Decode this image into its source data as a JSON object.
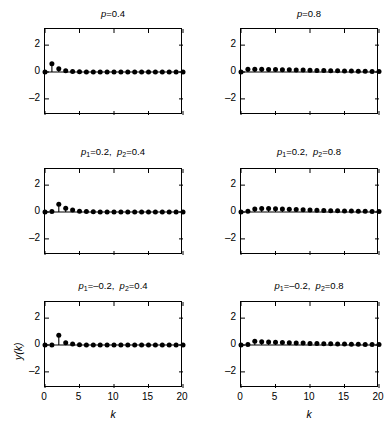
{
  "figure": {
    "width": 392,
    "height": 438,
    "background": "#ffffff",
    "ink_color": "#000000"
  },
  "axis_labels": {
    "x": "k",
    "y": "y(k)"
  },
  "chart_data": [
    {
      "type": "line",
      "panel_id": "panel-top-left",
      "title": "p=0.4",
      "title_parts": {
        "var": "p",
        "sub": "",
        "value": "=0.4"
      },
      "xlabel": "k",
      "ylabel": "y(k)",
      "xlim": [
        0,
        20
      ],
      "ylim": [
        -3.2,
        3.2
      ],
      "xticks": [
        0,
        5,
        10,
        15,
        20
      ],
      "yticks": [
        -2,
        0,
        2
      ],
      "xticklabels": [
        "0",
        "5",
        "10",
        "15",
        "20"
      ],
      "yticklabels": [
        "-2",
        "0",
        "2"
      ],
      "grid": false,
      "legend": null,
      "marker": "filled-circle",
      "stem_plot": true,
      "x": [
        0,
        1,
        2,
        3,
        4,
        5,
        6,
        7,
        8,
        9,
        10,
        11,
        12,
        13,
        14,
        15,
        16,
        17,
        18,
        19,
        20
      ],
      "values": [
        0.0,
        0.62,
        0.25,
        0.1,
        0.04,
        0.016,
        0.006,
        0.003,
        0.001,
        0.0,
        0.0,
        0.0,
        0.0,
        0.0,
        0.0,
        0.0,
        0.0,
        0.0,
        0.0,
        0.0,
        0.0
      ]
    },
    {
      "type": "line",
      "panel_id": "panel-top-right",
      "title": "p=0.8",
      "title_parts": {
        "var": "p",
        "sub": "",
        "value": "=0.8"
      },
      "xlabel": "k",
      "ylabel": "y(k)",
      "xlim": [
        0,
        20
      ],
      "ylim": [
        -3.2,
        3.2
      ],
      "xticks": [
        0,
        5,
        10,
        15,
        20
      ],
      "yticks": [
        -2,
        0,
        2
      ],
      "xticklabels": [
        "0",
        "5",
        "10",
        "15",
        "20"
      ],
      "yticklabels": [
        "-2",
        "0",
        "2"
      ],
      "grid": false,
      "legend": null,
      "marker": "filled-circle",
      "stem_plot": true,
      "x": [
        0,
        1,
        2,
        3,
        4,
        5,
        6,
        7,
        8,
        9,
        10,
        11,
        12,
        13,
        14,
        15,
        16,
        17,
        18,
        19,
        20
      ],
      "values": [
        0.0,
        0.2,
        0.2,
        0.2,
        0.19,
        0.18,
        0.17,
        0.16,
        0.15,
        0.14,
        0.13,
        0.12,
        0.11,
        0.1,
        0.09,
        0.08,
        0.07,
        0.06,
        0.05,
        0.04,
        0.03
      ]
    },
    {
      "type": "line",
      "panel_id": "panel-mid-left",
      "title": "p1=0.2, p2=0.4",
      "title_parts": {
        "var": "p",
        "sub": "1",
        "value": "=0.2,",
        "var2": "p",
        "sub2": "2",
        "value2": "=0.4"
      },
      "xlabel": "k",
      "ylabel": "y(k)",
      "xlim": [
        0,
        20
      ],
      "ylim": [
        -3.2,
        3.2
      ],
      "xticks": [
        0,
        5,
        10,
        15,
        20
      ],
      "yticks": [
        -2,
        0,
        2
      ],
      "xticklabels": [
        "0",
        "5",
        "10",
        "15",
        "20"
      ],
      "yticklabels": [
        "-2",
        "0",
        "2"
      ],
      "grid": false,
      "legend": null,
      "marker": "filled-circle",
      "stem_plot": true,
      "x": [
        0,
        1,
        2,
        3,
        4,
        5,
        6,
        7,
        8,
        9,
        10,
        11,
        12,
        13,
        14,
        15,
        16,
        17,
        18,
        19,
        20
      ],
      "values": [
        0.0,
        0.04,
        0.58,
        0.28,
        0.14,
        0.06,
        0.03,
        0.012,
        0.005,
        0.002,
        0.001,
        0.0,
        0.0,
        0.0,
        0.0,
        0.0,
        0.0,
        0.0,
        0.0,
        0.0,
        0.0
      ]
    },
    {
      "type": "line",
      "panel_id": "panel-mid-right",
      "title": "p1=0.2, p2=0.8",
      "title_parts": {
        "var": "p",
        "sub": "1",
        "value": "=0.2,",
        "var2": "p",
        "sub2": "2",
        "value2": "=0.8"
      },
      "xlabel": "k",
      "ylabel": "y(k)",
      "xlim": [
        0,
        20
      ],
      "ylim": [
        -3.2,
        3.2
      ],
      "xticks": [
        0,
        5,
        10,
        15,
        20
      ],
      "yticks": [
        -2,
        0,
        2
      ],
      "xticklabels": [
        "0",
        "5",
        "10",
        "15",
        "20"
      ],
      "yticklabels": [
        "-2",
        "0",
        "2"
      ],
      "grid": false,
      "legend": null,
      "marker": "filled-circle",
      "stem_plot": true,
      "x": [
        0,
        1,
        2,
        3,
        4,
        5,
        6,
        7,
        8,
        9,
        10,
        11,
        12,
        13,
        14,
        15,
        16,
        17,
        18,
        19,
        20
      ],
      "values": [
        0.0,
        0.05,
        0.22,
        0.26,
        0.26,
        0.25,
        0.23,
        0.21,
        0.19,
        0.17,
        0.15,
        0.13,
        0.12,
        0.1,
        0.09,
        0.08,
        0.07,
        0.06,
        0.05,
        0.04,
        0.03
      ]
    },
    {
      "type": "line",
      "panel_id": "panel-bot-left",
      "title": "p1=-0.2, p2=0.4",
      "title_parts": {
        "var": "p",
        "sub": "1",
        "value": "=–0.2,",
        "var2": "p",
        "sub2": "2",
        "value2": "=0.4"
      },
      "xlabel": "k",
      "ylabel": "y(k)",
      "xlim": [
        0,
        20
      ],
      "ylim": [
        -3.2,
        3.2
      ],
      "xticks": [
        0,
        5,
        10,
        15,
        20
      ],
      "yticks": [
        -2,
        0,
        2
      ],
      "xticklabels": [
        "0",
        "5",
        "10",
        "15",
        "20"
      ],
      "yticklabels": [
        "-2",
        "0",
        "2"
      ],
      "grid": false,
      "legend": null,
      "marker": "filled-circle",
      "stem_plot": true,
      "x": [
        0,
        1,
        2,
        3,
        4,
        5,
        6,
        7,
        8,
        9,
        10,
        11,
        12,
        13,
        14,
        15,
        16,
        17,
        18,
        19,
        20
      ],
      "values": [
        0.0,
        0.0,
        0.72,
        0.17,
        0.07,
        0.02,
        0.008,
        0.003,
        0.001,
        0.0,
        0.0,
        0.0,
        0.0,
        0.0,
        0.0,
        0.0,
        0.0,
        0.0,
        0.0,
        0.0,
        0.0
      ]
    },
    {
      "type": "line",
      "panel_id": "panel-bot-right",
      "title": "p1=-0.2, p2=0.8",
      "title_parts": {
        "var": "p",
        "sub": "1",
        "value": "=–0.2,",
        "var2": "p",
        "sub2": "2",
        "value2": "=0.8"
      },
      "xlabel": "k",
      "ylabel": "y(k)",
      "xlim": [
        0,
        20
      ],
      "ylim": [
        -3.2,
        3.2
      ],
      "xticks": [
        0,
        5,
        10,
        15,
        20
      ],
      "yticks": [
        -2,
        0,
        2
      ],
      "xticklabels": [
        "0",
        "5",
        "10",
        "15",
        "20"
      ],
      "yticklabels": [
        "-2",
        "0",
        "2"
      ],
      "grid": false,
      "legend": null,
      "marker": "filled-circle",
      "stem_plot": true,
      "x": [
        0,
        1,
        2,
        3,
        4,
        5,
        6,
        7,
        8,
        9,
        10,
        11,
        12,
        13,
        14,
        15,
        16,
        17,
        18,
        19,
        20
      ],
      "values": [
        0.0,
        0.03,
        0.28,
        0.24,
        0.22,
        0.2,
        0.18,
        0.17,
        0.15,
        0.14,
        0.12,
        0.11,
        0.1,
        0.09,
        0.08,
        0.07,
        0.06,
        0.05,
        0.04,
        0.035,
        0.03
      ]
    }
  ],
  "layout": {
    "rows": 3,
    "cols": 2,
    "panel_positions": [
      {
        "id": "panel-top-left",
        "left": 44,
        "top": 28,
        "width": 138,
        "height": 86
      },
      {
        "id": "panel-top-right",
        "left": 240,
        "top": 28,
        "width": 138,
        "height": 86
      },
      {
        "id": "panel-mid-left",
        "left": 44,
        "top": 168,
        "width": 138,
        "height": 86
      },
      {
        "id": "panel-mid-right",
        "left": 240,
        "top": 168,
        "width": 138,
        "height": 86
      },
      {
        "id": "panel-bot-left",
        "left": 44,
        "top": 301,
        "width": 138,
        "height": 86
      },
      {
        "id": "panel-bot-right",
        "left": 240,
        "top": 301,
        "width": 138,
        "height": 86
      }
    ],
    "title_offsets": [
      {
        "id": "panel-top-left",
        "left": 14,
        "top": 8
      },
      {
        "id": "panel-top-right",
        "left": 210,
        "top": 8
      },
      {
        "id": "panel-mid-left",
        "left": 14,
        "top": 146
      },
      {
        "id": "panel-mid-right",
        "left": 210,
        "top": 146
      },
      {
        "id": "panel-bot-left",
        "left": 14,
        "top": 280
      },
      {
        "id": "panel-bot-right",
        "left": 210,
        "top": 280
      }
    ]
  }
}
